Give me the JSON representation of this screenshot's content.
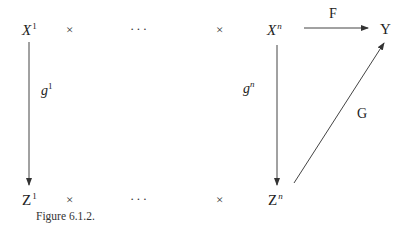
{
  "diagram": {
    "top_row": {
      "first": {
        "base": "X",
        "sup": "1"
      },
      "times_1": "×",
      "dots": "···",
      "times_2": "×",
      "last": {
        "base": "X",
        "sup": "n"
      },
      "target": "Y"
    },
    "bottom_row": {
      "first": {
        "base": "Z",
        "sup": "1"
      },
      "times_1": "×",
      "dots": "···",
      "times_2": "×",
      "last": {
        "base": "Z",
        "sup": "n"
      }
    },
    "arrows": {
      "F": {
        "label": "F",
        "from": "X^n",
        "to": "Y"
      },
      "g1": {
        "label_base": "g",
        "label_sup": "1",
        "from": "X^1",
        "to": "Z^1"
      },
      "gn": {
        "label_base": "g",
        "label_sup": "n",
        "from": "X^n",
        "to": "Z^n"
      },
      "G": {
        "label": "G",
        "from": "Z^n",
        "to": "Y"
      }
    },
    "caption": "Figure 6.1.2."
  }
}
